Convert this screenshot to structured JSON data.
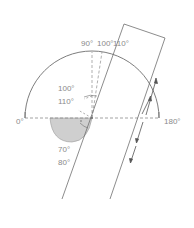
{
  "diagram": {
    "type": "protractor-angle-diagram",
    "colors": {
      "stroke": "#6e6e6e",
      "dashed": "#8c8c8c",
      "label": "#8a8a8a",
      "shade": "#cfcfcf"
    },
    "labels": {
      "left_end": "0°",
      "right_end": "180°",
      "top_90": "90°",
      "top_100": "100°",
      "top_110": "110°",
      "inner_100": "100°",
      "inner_110": "110°",
      "lower_70": "70°",
      "lower_80": "80°"
    }
  }
}
